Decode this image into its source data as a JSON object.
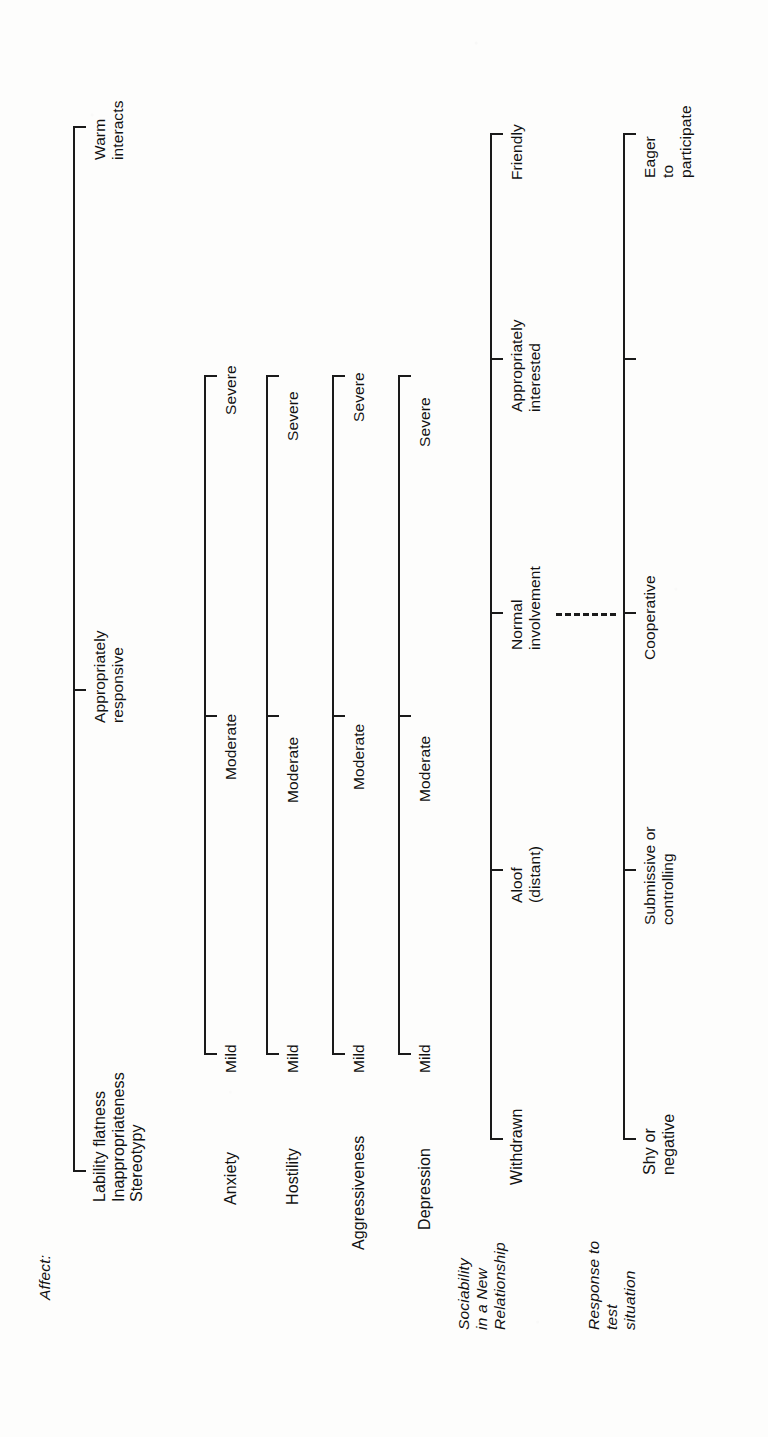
{
  "document": {
    "orientation": "rotated-90-ccw",
    "kind": "clinical rating scale diagram",
    "ink_color": "#1a1a1a",
    "paper_color": "#fdfdfc"
  },
  "groups": {
    "affect": {
      "heading": "Affect:"
    },
    "sociability": {
      "heading_lines": [
        "Sociability",
        "in a New",
        "Relationship"
      ]
    },
    "response": {
      "heading_lines": [
        "Response to",
        "test",
        "situation"
      ]
    }
  },
  "scales": [
    {
      "id": "affect",
      "row_label_lines": [
        "Lability flatness",
        "Inappropriateness",
        "Stereotypy"
      ],
      "anchors": [
        {
          "lines": [
            "Warm",
            "interacts"
          ]
        },
        {
          "lines": [
            "Appropriately",
            "responsive"
          ]
        }
      ]
    },
    {
      "id": "anxiety",
      "row_label_lines": [
        "Anxiety"
      ],
      "anchors": [
        {
          "lines": [
            "Severe"
          ]
        },
        {
          "lines": [
            "Moderate"
          ]
        },
        {
          "lines": [
            "Mild"
          ]
        }
      ]
    },
    {
      "id": "hostility",
      "row_label_lines": [
        "Hostility"
      ],
      "anchors": [
        {
          "lines": [
            "Severe"
          ]
        },
        {
          "lines": [
            "Moderate"
          ]
        },
        {
          "lines": [
            "Mild"
          ]
        }
      ]
    },
    {
      "id": "aggressiveness",
      "row_label_lines": [
        "Aggressiveness"
      ],
      "anchors": [
        {
          "lines": [
            "Severe"
          ]
        },
        {
          "lines": [
            "Moderate"
          ]
        },
        {
          "lines": [
            "Mild"
          ]
        }
      ]
    },
    {
      "id": "depression",
      "row_label_lines": [
        "Depression"
      ],
      "anchors": [
        {
          "lines": [
            "Severe"
          ]
        },
        {
          "lines": [
            "Moderate"
          ]
        },
        {
          "lines": [
            "Mild"
          ]
        }
      ]
    },
    {
      "id": "sociability",
      "row_label_lines": [
        "Withdrawn"
      ],
      "anchors": [
        {
          "lines": [
            "Friendly"
          ]
        },
        {
          "lines": [
            "Appropriately",
            "interested"
          ]
        },
        {
          "lines": [
            "Normal",
            "involvement"
          ]
        },
        {
          "lines": [
            "Aloof",
            "(distant)"
          ]
        },
        {
          "lines": [
            "Withdrawn"
          ]
        }
      ]
    },
    {
      "id": "response",
      "row_label_lines": [
        "Shy or",
        "negative"
      ],
      "anchors": [
        {
          "lines": [
            "Eager",
            "to",
            "participate"
          ]
        },
        {
          "lines": [
            "Cooperative"
          ]
        },
        {
          "lines": [
            "Submissive or",
            "controlling"
          ]
        },
        {
          "lines": [
            "Shy or",
            "negative"
          ]
        }
      ]
    }
  ],
  "connector": {
    "from": "Normal involvement",
    "to": "Cooperative",
    "style": "dashed"
  }
}
